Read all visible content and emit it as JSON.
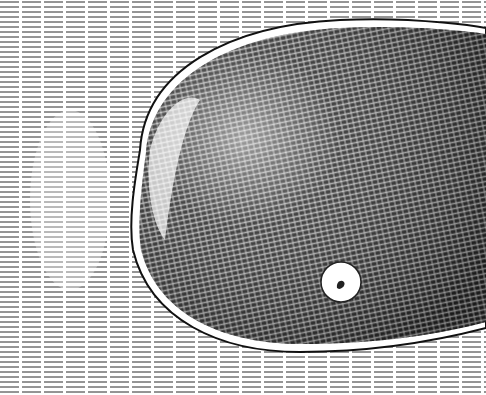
{
  "image": {
    "description": "Pen-and-ink cross-hatched drawing of a large dark oval blob with a small white circle, surrounded by horizontal hatch lines",
    "colors": {
      "paper": "#ffffff",
      "ink": "#1a1a1a"
    },
    "blob": {
      "cx": 318,
      "cy": 178,
      "rx": 190,
      "ry": 160
    },
    "dot": {
      "cx": 341,
      "cy": 282,
      "r": 20
    }
  }
}
